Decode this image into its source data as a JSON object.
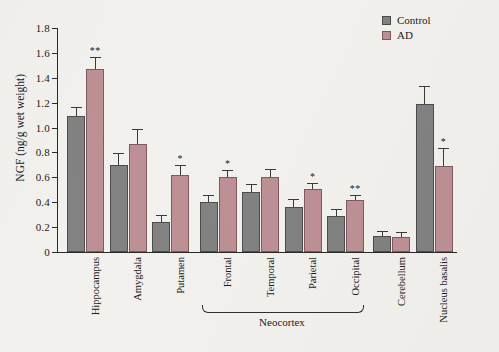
{
  "chart_data": {
    "type": "bar",
    "title": "",
    "xlabel": "",
    "ylabel": "NGF (ng/g wet weight)",
    "ylim": [
      0,
      1.8
    ],
    "ytick_labels": [
      "0",
      "0.2",
      "0.4",
      "0.6",
      "0.8",
      "1.0",
      "1.2",
      "1.4",
      "1.6",
      "1.8"
    ],
    "ytick_values": [
      0,
      0.2,
      0.4,
      0.6,
      0.8,
      1.0,
      1.2,
      1.4,
      1.6,
      1.8
    ],
    "grid": false,
    "legend_position": "top-right",
    "categories": [
      "Hippocampus",
      "Amygdala",
      "Putamen",
      "Frontal",
      "Temporal",
      "Parietal",
      "Occipital",
      "Cerebellum",
      "Nucleus basalis"
    ],
    "series": [
      {
        "name": "Control",
        "color": "#828282",
        "values": [
          1.09,
          0.7,
          0.24,
          0.4,
          0.48,
          0.36,
          0.29,
          0.13,
          1.19
        ],
        "errors": [
          0.07,
          0.09,
          0.05,
          0.05,
          0.06,
          0.06,
          0.05,
          0.03,
          0.14
        ]
      },
      {
        "name": "AD",
        "color": "#bd9095",
        "values": [
          1.47,
          0.87,
          0.62,
          0.6,
          0.6,
          0.51,
          0.42,
          0.12,
          0.69
        ],
        "errors": [
          0.09,
          0.11,
          0.07,
          0.05,
          0.06,
          0.04,
          0.03,
          0.03,
          0.14
        ]
      }
    ],
    "significance_markers": [
      {
        "category": "Hippocampus",
        "series": "AD",
        "marker": "**"
      },
      {
        "category": "Putamen",
        "series": "AD",
        "marker": "*"
      },
      {
        "category": "Frontal",
        "series": "AD",
        "marker": "*"
      },
      {
        "category": "Parietal",
        "series": "AD",
        "marker": "*"
      },
      {
        "category": "Occipital",
        "series": "AD",
        "marker": "**"
      },
      {
        "category": "Nucleus basalis",
        "series": "AD",
        "marker": "*"
      }
    ],
    "annotations": [
      {
        "text": "Neocortex",
        "spans": [
          "Frontal",
          "Temporal",
          "Parietal",
          "Occipital"
        ]
      }
    ]
  },
  "legend": {
    "items": [
      {
        "label": "Control",
        "color": "#828282"
      },
      {
        "label": "AD",
        "color": "#bd9095"
      }
    ]
  },
  "axes": {
    "y_title": "NGF (ng/g wet weight)"
  },
  "bracket": {
    "label": "Neocortex"
  }
}
